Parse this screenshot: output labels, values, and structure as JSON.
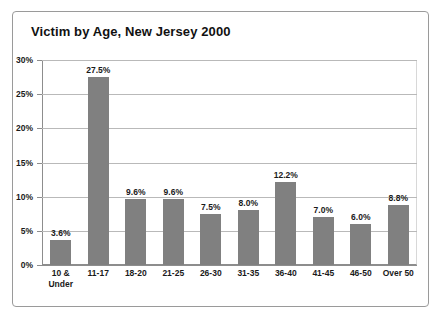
{
  "chart_data": {
    "type": "bar",
    "title": "Victim by Age, New Jersey 2000",
    "xlabel": "",
    "ylabel": "",
    "ylim": [
      0,
      30
    ],
    "grid": true,
    "legend": false,
    "bar_color": "#808080",
    "categories": [
      "10 &\nUnder",
      "11-17",
      "18-20",
      "21-25",
      "26-30",
      "31-35",
      "36-40",
      "41-45",
      "46-50",
      "Over 50"
    ],
    "values": [
      3.6,
      27.5,
      9.6,
      9.6,
      7.5,
      8.0,
      12.2,
      7.0,
      6.0,
      8.8
    ],
    "data_labels": [
      "3.6%",
      "27.5%",
      "9.6%",
      "9.6%",
      "7.5%",
      "8.0%",
      "12.2%",
      "7.0%",
      "6.0%",
      "8.8%"
    ],
    "yticks": [
      0,
      5,
      10,
      15,
      20,
      25,
      30
    ],
    "ytick_labels": [
      "0%",
      "5%",
      "10%",
      "15%",
      "20%",
      "25%",
      "30%"
    ]
  }
}
